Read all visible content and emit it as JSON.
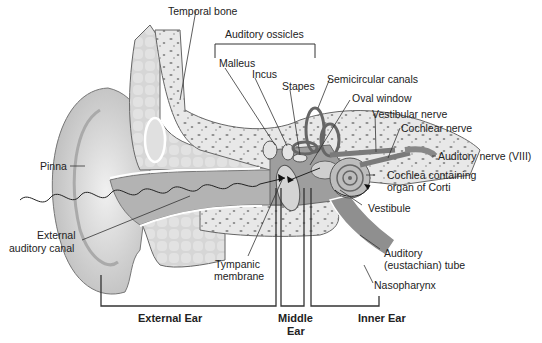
{
  "diagram": {
    "colors": {
      "bone": "#e6e6e6",
      "bone_spots": "#8a8a8a",
      "cartilage": "#cfcfcf",
      "canal": "#9a9a9a",
      "outline": "#555555",
      "text": "#222222"
    },
    "labels": {
      "temporal_bone": "Temporal bone",
      "auditory_ossicles": "Auditory ossicles",
      "malleus": "Malleus",
      "incus": "Incus",
      "stapes": "Stapes",
      "semicircular_canals": "Semicircular canals",
      "oval_window": "Oval window",
      "vestibular_nerve": "Vestibular nerve",
      "cochlear_nerve": "Cochlear nerve",
      "auditory_nerve": "Auditory nerve (VIII)",
      "cochlea_line1": "Cochlea containing",
      "cochlea_line2": "organ of Corti",
      "vestibule": "Vestibule",
      "pinna": "Pinna",
      "external_canal_line1": "External",
      "external_canal_line2": "auditory canal",
      "tympanic_line1": "Tympanic",
      "tympanic_line2": "membrane",
      "eustachian_line1": "Auditory",
      "eustachian_line2": "(eustachian) tube",
      "nasopharynx": "Nasopharynx"
    },
    "sections": {
      "external": "External Ear",
      "middle_line1": "Middle",
      "middle_line2": "Ear",
      "inner": "Inner Ear"
    }
  }
}
